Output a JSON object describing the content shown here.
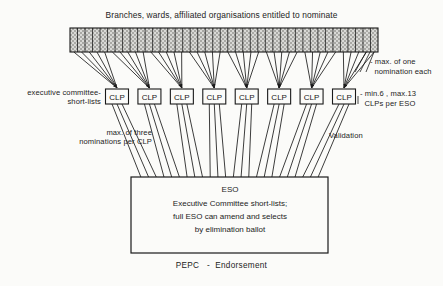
{
  "diagram": {
    "title": "Branches, wards, affiliated organisations entitled to nominate",
    "background_color": "#fbfbf9",
    "ink_color": "#1a1a1a",
    "source_bar": {
      "name": "nominating-bodies-bar",
      "fill": "hatched",
      "cells": 41,
      "x": 70,
      "y": 28,
      "width": 308,
      "height": 24
    },
    "annotations": {
      "max_one_nomination": "- max. of one\n  nomination each",
      "exec_committee_shortlists": "executive committee-\nshort-lists",
      "min_max_clps": "- min.6 , max.13\n  CLPs per ESO",
      "max_three_nominations": "max. of three\nnominations per CLP",
      "validation": "Validation"
    },
    "clp_nodes": [
      {
        "label": "CLP"
      },
      {
        "label": "CLP"
      },
      {
        "label": "CLP"
      },
      {
        "label": "CLP"
      },
      {
        "label": "CLP"
      },
      {
        "label": "CLP"
      },
      {
        "label": "CLP"
      },
      {
        "label": "CLP"
      }
    ],
    "eso_box": {
      "title": "ESO",
      "line_1": "Executive Committee short-lists;",
      "line_2": "full ESO can amend and selects",
      "line_3": "by elimination ballot"
    },
    "footer": "PEPC   -  Endorsement"
  }
}
